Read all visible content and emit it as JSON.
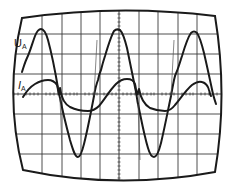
{
  "figure": {
    "type": "oscilloscope-trace",
    "colors": {
      "background": "#ffffff",
      "ink": "#1a1a1a",
      "grid": "#3a3a3a"
    },
    "grid": {
      "verticals": [
        42,
        62,
        81,
        100,
        119,
        139,
        158,
        178,
        197
      ],
      "horizontals": [
        34,
        54,
        74,
        94,
        114,
        134,
        154
      ],
      "center_x": 119,
      "center_y": 94
    },
    "traces": [
      {
        "name": "voltage",
        "label_main": "U",
        "label_sub": "A",
        "label_pos": [
          14,
          47
        ]
      },
      {
        "name": "current",
        "label_main": "I",
        "label_sub": "A",
        "label_pos": [
          18,
          89
        ]
      }
    ]
  }
}
